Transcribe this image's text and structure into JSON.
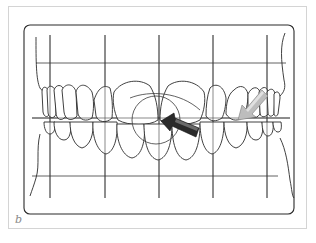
{
  "figure": {
    "panel_label": "b",
    "grid": {
      "vertical_lines_x": [
        50,
        105,
        159,
        213,
        267
      ],
      "horizontal_lines_y": [
        63,
        118,
        176
      ]
    },
    "arrows": [
      {
        "name": "dark-arrow",
        "color": "#2a2a2a",
        "direction": "toward upper-left, pointing at midline"
      },
      {
        "name": "light-arrow",
        "color": "#b8b8b8",
        "direction": "toward lower-left, on right canine area"
      }
    ],
    "colors": {
      "line": "#2b2b2b",
      "frame": "#d4d4d4",
      "label": "#8a8a8a"
    }
  }
}
